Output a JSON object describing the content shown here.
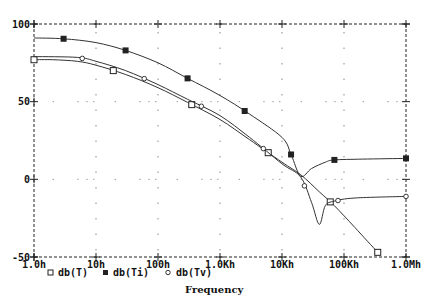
{
  "chart_data": {
    "type": "line",
    "title": "",
    "xlabel": "Frequency",
    "ylabel": "",
    "x_scale": "log",
    "x_ticks": [
      1,
      10,
      100,
      1000,
      10000,
      100000,
      1000000
    ],
    "x_tick_labels": [
      "1.0h",
      "10h",
      "100h",
      "1.0Kh",
      "10Kh",
      "100Kh",
      "1.0Mh"
    ],
    "y_ticks": [
      100,
      50,
      0,
      -50
    ],
    "y_tick_labels": [
      "100",
      "50",
      "0",
      "-50"
    ],
    "ylim": [
      -50,
      100
    ],
    "xlim": [
      1,
      1000000
    ],
    "grid": "dotted",
    "legend_position": "bottom-left",
    "series": [
      {
        "name": "db(T)",
        "marker": "open-square",
        "x": [
          1,
          2,
          5,
          10,
          30,
          100,
          300,
          1000,
          3000,
          10000,
          20000,
          40000,
          70000,
          150000,
          350000
        ],
        "y": [
          77,
          77,
          76,
          73.5,
          67.5,
          59,
          49.5,
          38.5,
          25.5,
          11,
          3,
          -8,
          -17,
          -31,
          -47
        ],
        "marker_x": [
          1,
          19,
          350,
          6000,
          60000,
          350000
        ]
      },
      {
        "name": "db(Ti)",
        "marker": "filled-square",
        "x": [
          1,
          3,
          10,
          30,
          100,
          300,
          1000,
          3000,
          10000,
          14000,
          20000,
          30000,
          50000,
          70000,
          200000,
          1000000
        ],
        "y": [
          91,
          90.5,
          88,
          83,
          75,
          65,
          54,
          42,
          27,
          16,
          2,
          7,
          11,
          12.5,
          13,
          13.5
        ],
        "marker_x": [
          3,
          30,
          300,
          2500,
          14000,
          70000,
          1000000
        ]
      },
      {
        "name": "db(Tv)",
        "marker": "open-diamond",
        "x": [
          1,
          5,
          10,
          30,
          100,
          300,
          1000,
          3000,
          10000,
          20000,
          30000,
          40000,
          50000,
          70000,
          150000,
          1000000
        ],
        "y": [
          79,
          78.5,
          76,
          70,
          61,
          51.5,
          41,
          27,
          10,
          1.5,
          -15,
          -29,
          -17,
          -14,
          -12,
          -11
        ],
        "marker_x": [
          6,
          60,
          500,
          5000,
          23000,
          80000,
          1000000
        ]
      }
    ]
  },
  "legend": {
    "items": [
      {
        "symbol": "open-square",
        "label": "db(T)"
      },
      {
        "symbol": "filled-square",
        "label": "db(Ti)"
      },
      {
        "symbol": "open-diamond",
        "label": "db(Tv)"
      }
    ]
  },
  "colors": {
    "line": "#333333",
    "frame": "#222222",
    "grid": "#888888",
    "background": "#ffffff"
  }
}
